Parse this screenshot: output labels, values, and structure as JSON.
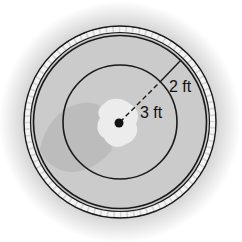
{
  "diagram": {
    "labels": {
      "inner_radius": "3 ft",
      "ring_width": "2 ft"
    },
    "colors": {
      "background": "#ffffff",
      "surface": "#cfcfcf",
      "shadow_patch": "#b5b5b5",
      "splash": "#ececec",
      "line": "#1a1a1a",
      "rim_tile": "#f4f4f4"
    }
  }
}
